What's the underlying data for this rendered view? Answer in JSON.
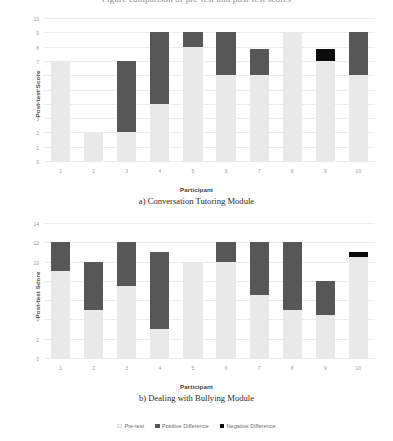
{
  "header": {
    "clipped_line": "Figure comparison of pre-test and post-test scores"
  },
  "legend": {
    "items": [
      {
        "label": "Pre-test",
        "swatch": "pre",
        "color": "#eeeeee"
      },
      {
        "label": "Positive Difference",
        "swatch": "pos",
        "color": "#575757"
      },
      {
        "label": "Negative Difference",
        "swatch": "neg",
        "color": "#0d0d0d"
      }
    ]
  },
  "charts": [
    {
      "id": "a",
      "caption": "a) Conversation Tutoring Module",
      "xlabel": "Participant",
      "ylabel": "Post-test Score"
    },
    {
      "id": "b",
      "caption": "b) Dealing with Bullying Module",
      "xlabel": "Participant",
      "ylabel": "Post-test Score"
    }
  ],
  "chart_data": [
    {
      "type": "bar",
      "subtype": "stacked-floating-bar",
      "title": "a) Conversation Tutoring Module",
      "xlabel": "Participant",
      "ylabel": "Post-test Score",
      "categories": [
        "1",
        "2",
        "3",
        "4",
        "5",
        "6",
        "7",
        "8",
        "9",
        "10"
      ],
      "yticks": [
        0,
        1,
        2,
        3,
        4,
        5,
        6,
        7,
        8,
        9,
        10
      ],
      "ylim": [
        0,
        10
      ],
      "grid": true,
      "legend_position": "bottom",
      "series": [
        {
          "name": "Pre-test",
          "color": "#e9e9e9",
          "values": [
            7,
            2,
            2,
            4,
            8,
            6,
            6,
            9,
            7,
            6
          ]
        },
        {
          "name": "Positive Difference",
          "color": "#575757",
          "values": [
            0,
            0,
            5,
            5,
            1,
            3,
            1.8,
            0,
            0,
            3
          ]
        },
        {
          "name": "Negative Difference",
          "color": "#0d0d0d",
          "values": [
            0,
            0,
            0,
            0,
            0,
            0,
            0,
            0,
            0.8,
            0
          ]
        }
      ],
      "post_test_totals": [
        7,
        2,
        7,
        9,
        9,
        9,
        7.8,
        9,
        7.8,
        9
      ]
    },
    {
      "type": "bar",
      "subtype": "stacked-floating-bar",
      "title": "b) Dealing with Bullying Module",
      "xlabel": "Participant",
      "ylabel": "Post-test Score",
      "categories": [
        "1",
        "2",
        "3",
        "4",
        "5",
        "6",
        "7",
        "8",
        "9",
        "10"
      ],
      "yticks": [
        0,
        2,
        4,
        6,
        8,
        10,
        12,
        14
      ],
      "ylim": [
        0,
        14
      ],
      "grid": true,
      "legend_position": "bottom",
      "series": [
        {
          "name": "Pre-test",
          "color": "#e9e9e9",
          "values": [
            9,
            5,
            7.5,
            3,
            10,
            10,
            6.5,
            5,
            4.5,
            10.5
          ]
        },
        {
          "name": "Positive Difference",
          "color": "#575757",
          "values": [
            3,
            5,
            4.5,
            8,
            0,
            2,
            5.5,
            7,
            3.5,
            0
          ]
        },
        {
          "name": "Negative Difference",
          "color": "#0d0d0d",
          "values": [
            0,
            0,
            0,
            0,
            0,
            0,
            0,
            0,
            0,
            0.5
          ]
        }
      ],
      "post_test_totals": [
        12,
        10,
        12,
        11,
        10,
        12,
        12,
        12,
        8,
        11
      ]
    }
  ]
}
